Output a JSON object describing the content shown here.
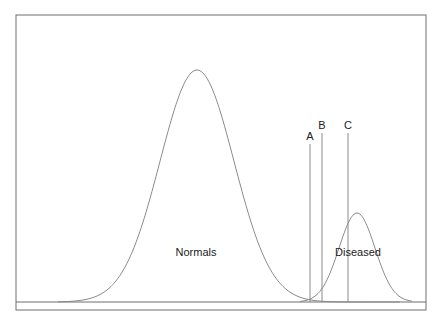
{
  "diagram": {
    "type": "overlapping-distributions",
    "frame": {
      "left": 16,
      "top": 15,
      "right": 426,
      "bottom": 310
    },
    "baseline_y": 302,
    "distributions": [
      {
        "name": "Normals",
        "label": "Normals",
        "peak_x": 197,
        "peak_y": 70,
        "sd_px": 37,
        "extent": [
          58,
          400
        ],
        "label_x": 196,
        "label_y": 256
      },
      {
        "name": "Diseased",
        "label": "Diseased",
        "peak_x": 357,
        "peak_y": 213,
        "sd_px": 18,
        "extent": [
          300,
          412
        ],
        "label_x": 358,
        "label_y": 256
      }
    ],
    "cutoffs": [
      {
        "label": "A",
        "x": 310,
        "top": 144
      },
      {
        "label": "B",
        "x": 322,
        "top": 133
      },
      {
        "label": "C",
        "x": 348,
        "top": 133
      }
    ],
    "colors": {
      "stroke": "#8a8a8a",
      "frame": "#6e6e6e",
      "text": "#222222"
    }
  },
  "labels": {
    "normals": "Normals",
    "diseased": "Diseased",
    "cutoff_a": "A",
    "cutoff_b": "B",
    "cutoff_c": "C"
  }
}
